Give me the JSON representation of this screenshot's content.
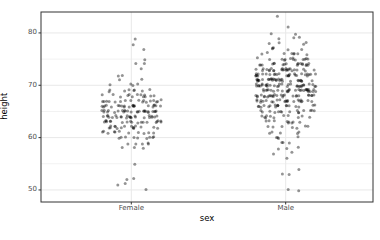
{
  "chart_data": {
    "type": "scatter",
    "subtype": "jittered-strip-plot",
    "title": "",
    "xlabel": "sex",
    "ylabel": "height",
    "categories": [
      "Female",
      "Male"
    ],
    "y_ticks": [
      50,
      60,
      70,
      80
    ],
    "y_tick_labels": [
      "50",
      "60",
      "70",
      "80"
    ],
    "ylim": [
      47.7,
      84.0
    ],
    "grid": "major-and-minor-horizontal, major-vertical-at-categories",
    "legend": "none",
    "series": [
      {
        "name": "Female",
        "height_counts": [
          [
            79,
            1
          ],
          [
            78,
            1
          ],
          [
            77,
            1
          ],
          [
            75,
            1
          ],
          [
            74,
            2
          ],
          [
            73,
            1
          ],
          [
            72,
            2
          ],
          [
            71,
            2
          ],
          [
            70,
            4
          ],
          [
            69,
            8
          ],
          [
            68,
            13
          ],
          [
            67,
            17
          ],
          [
            66,
            22
          ],
          [
            65,
            26
          ],
          [
            64,
            24
          ],
          [
            63,
            19
          ],
          [
            62,
            16
          ],
          [
            61,
            11
          ],
          [
            60,
            9
          ],
          [
            59,
            5
          ],
          [
            58,
            3
          ],
          [
            55,
            1
          ],
          [
            52,
            2
          ],
          [
            51,
            2
          ],
          [
            50,
            1
          ]
        ]
      },
      {
        "name": "Male",
        "height_counts": [
          [
            83,
            1
          ],
          [
            81,
            1
          ],
          [
            80,
            2
          ],
          [
            79,
            3
          ],
          [
            78,
            4
          ],
          [
            77,
            5
          ],
          [
            76,
            8
          ],
          [
            75,
            13
          ],
          [
            74,
            19
          ],
          [
            73,
            25
          ],
          [
            72,
            28
          ],
          [
            71,
            30
          ],
          [
            70,
            32
          ],
          [
            69,
            30
          ],
          [
            68,
            27
          ],
          [
            67,
            23
          ],
          [
            66,
            18
          ],
          [
            65,
            15
          ],
          [
            64,
            11
          ],
          [
            63,
            9
          ],
          [
            62,
            7
          ],
          [
            61,
            5
          ],
          [
            60,
            4
          ],
          [
            59,
            3
          ],
          [
            58,
            3
          ],
          [
            57,
            2
          ],
          [
            56,
            1
          ],
          [
            54,
            1
          ],
          [
            53,
            2
          ],
          [
            50,
            2
          ]
        ]
      }
    ]
  },
  "style": {
    "background": "#ffffff",
    "panel_background": "#ffffff",
    "panel_border": "#333333",
    "grid_major": "#e8e8e8",
    "grid_minor": "#f2f2f2",
    "tick_mark": "#333333",
    "tick_label_color": "#4d4d4d",
    "axis_title_color": "#000000",
    "point_color": "#000000",
    "point_opacity": 0.42
  }
}
